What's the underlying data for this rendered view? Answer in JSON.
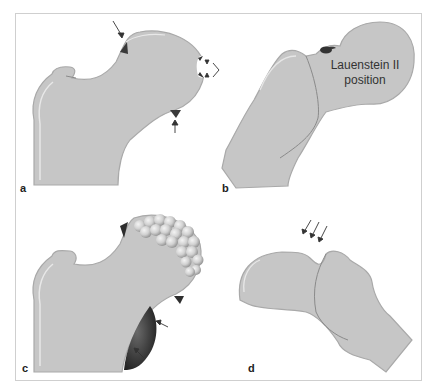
{
  "figure": {
    "colors": {
      "bone_fill": "#c6c6c6",
      "bone_edge": "#a9a9a9",
      "highlight": "#e6e6e6",
      "osteophyte": "#3a3a3a",
      "frame": "#cfcfcf"
    },
    "panels": [
      {
        "id": "a",
        "label": "a",
        "description": "Femoral head with arrows marking osteophytes and defect"
      },
      {
        "id": "b",
        "label": "b",
        "description": "Lauenstein II position view",
        "annotation_line1": "Lauenstein II",
        "annotation_line2": "position"
      },
      {
        "id": "c",
        "label": "c",
        "description": "Femoral head with cauliflower-like osteophytes and arrows at inferior osteophyte"
      },
      {
        "id": "d",
        "label": "d",
        "description": "Rotated femoral head with three arrows"
      }
    ]
  }
}
